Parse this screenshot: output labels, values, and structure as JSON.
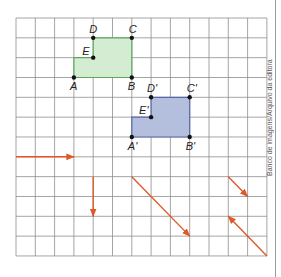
{
  "grid": {
    "origin_x": 16,
    "origin_y": 18,
    "cols": 13,
    "rows": 12,
    "cell_w": 19.3,
    "cell_h": 19.83,
    "line_color": "#8e8e8e"
  },
  "credit": "Banco de imagens/Arquivo da editora",
  "figures": [
    {
      "name": "original",
      "fill": "#d4ecd2",
      "stroke": "#5aa85a",
      "points": [
        {
          "label": "A",
          "col": 3,
          "row": 3,
          "lx": -4,
          "ly": 13
        },
        {
          "label": "B",
          "col": 6,
          "row": 3,
          "lx": -4,
          "ly": 13
        },
        {
          "label": "C",
          "col": 6,
          "row": 1,
          "lx": -3,
          "ly": -5
        },
        {
          "label": "D",
          "col": 4,
          "row": 1,
          "lx": -4,
          "ly": -5
        },
        {
          "label": "E",
          "col": 4,
          "row": 2,
          "lx": -11,
          "ly": -3
        }
      ],
      "polygon": [
        "A",
        "B",
        "C",
        "D",
        "E"
      ],
      "polygon_extra": [
        {
          "col": 3,
          "row": 2
        }
      ]
    },
    {
      "name": "translated",
      "fill": "#b3bfdc",
      "stroke": "#5468a8",
      "points": [
        {
          "label": "A'",
          "col": 6,
          "row": 6,
          "lx": -4,
          "ly": 13
        },
        {
          "label": "B'",
          "col": 9,
          "row": 6,
          "lx": -4,
          "ly": 13
        },
        {
          "label": "C'",
          "col": 9,
          "row": 4,
          "lx": -3,
          "ly": -5
        },
        {
          "label": "D'",
          "col": 7,
          "row": 4,
          "lx": -4,
          "ly": -5
        },
        {
          "label": "E'",
          "col": 7,
          "row": 5,
          "lx": -12,
          "ly": -3
        }
      ]
    }
  ],
  "arrows": [
    {
      "name": "horizontal-arrow",
      "from": {
        "col": 0,
        "row": 7
      },
      "to": {
        "col": 3,
        "row": 7
      }
    },
    {
      "name": "vertical-arrow",
      "from": {
        "col": 4,
        "row": 8
      },
      "to": {
        "col": 4,
        "row": 10
      }
    },
    {
      "name": "long-diagonal-arrow",
      "from": {
        "col": 6,
        "row": 8
      },
      "to": {
        "col": 9,
        "row": 11
      }
    },
    {
      "name": "short-diagonal-arrow",
      "from": {
        "col": 11,
        "row": 8
      },
      "to": {
        "col": 12,
        "row": 9
      }
    },
    {
      "name": "reverse-diagonal-arrow",
      "from": {
        "col": 13,
        "row": 12
      },
      "to": {
        "col": 11,
        "row": 10
      }
    }
  ],
  "arrow_color": "#e0582a"
}
